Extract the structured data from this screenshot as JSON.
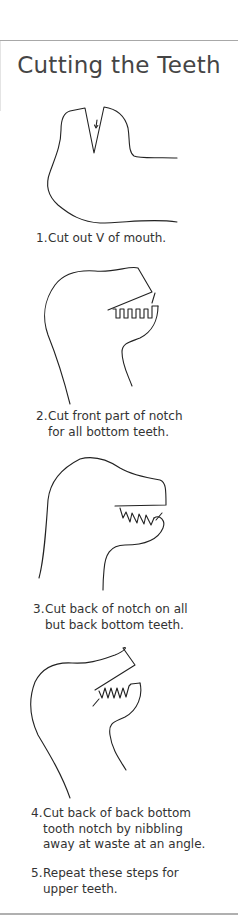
{
  "title": "Cutting the Teeth",
  "steps": [
    {
      "number": "1.",
      "lines": [
        "Cut out V of mouth."
      ]
    },
    {
      "number": "2.",
      "lines": [
        "Cut front part of notch",
        "for all bottom teeth."
      ]
    },
    {
      "number": "3.",
      "lines": [
        "Cut back of notch on all",
        "but back bottom teeth."
      ]
    },
    {
      "number": "4.",
      "lines": [
        "Cut back of back bottom",
        "tooth notch by nibbling",
        "away at waste at an angle."
      ]
    },
    {
      "number": "5.",
      "lines": [
        "Repeat these steps for",
        "upper teeth."
      ]
    }
  ],
  "colors": {
    "text": "#333333",
    "title": "#454545",
    "rule": "#a8a8a8"
  }
}
